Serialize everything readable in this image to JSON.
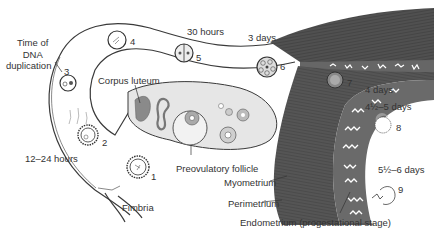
{
  "diagram": {
    "labels": {
      "time_of_dna": [
        "Time of",
        "DNA",
        "duplication"
      ],
      "hours_12_24": "12–24 hours",
      "hours_30": "30 hours",
      "days_3": "3 days",
      "days_4": "4 days",
      "days_45_5": "4½–5 days",
      "days_55_6": "5½–6 days",
      "corpus_luteum": "Corpus luteum",
      "preovulatory_follicle": "Preovulatory follicle",
      "fimbria": "Fimbria",
      "myometrium": "Myometrium",
      "perimetrium": "Perimetrium",
      "endometrium": "Endometrium (progestational stage)"
    },
    "stages": [
      {
        "n": "1",
        "desc": "Oocyte after ovulation"
      },
      {
        "n": "2",
        "desc": "Fertilization"
      },
      {
        "n": "3",
        "desc": "Pronuclei"
      },
      {
        "n": "4",
        "desc": "Zygote / first cleavage spindle"
      },
      {
        "n": "5",
        "desc": "Two-cell stage"
      },
      {
        "n": "6",
        "desc": "Morula"
      },
      {
        "n": "7",
        "desc": "Advanced morula"
      },
      {
        "n": "8",
        "desc": "Blastocyst"
      },
      {
        "n": "9",
        "desc": "Implanting blastocyst"
      }
    ],
    "colors": {
      "tissue_dark": "#4a4a4a",
      "tissue_mid": "#6e6e6e",
      "ovary_fill": "#e6e6e6",
      "outline": "#3a3a3a"
    }
  }
}
